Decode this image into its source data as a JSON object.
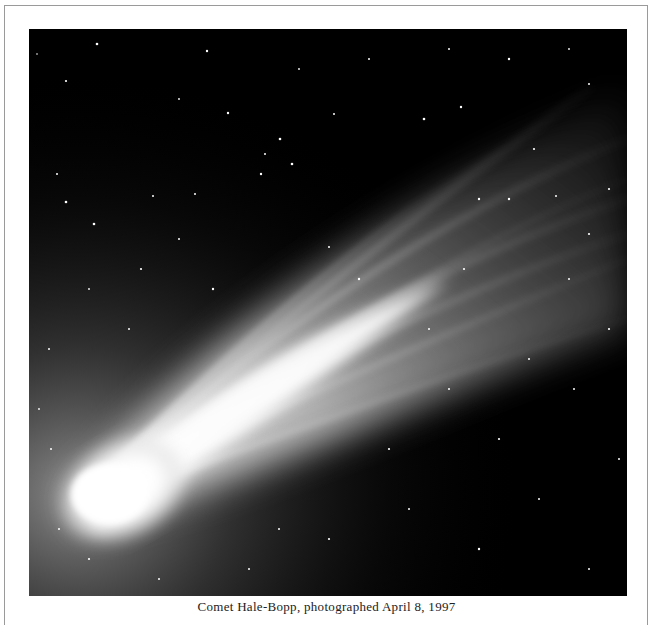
{
  "figure": {
    "caption": "Comet Hale-Bopp, photographed April 8, 1997",
    "colors": {
      "sky": "#000000",
      "coma": "#ffffff",
      "frame_border": "#9a9a9a",
      "page_background": "#ffffff"
    }
  }
}
